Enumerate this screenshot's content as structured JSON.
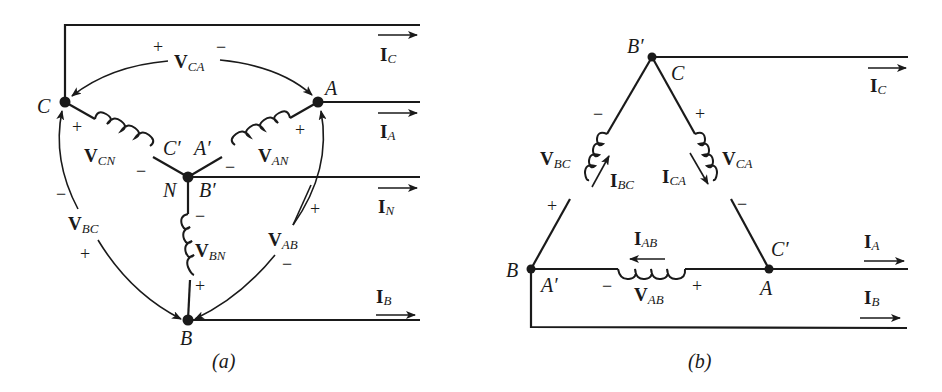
{
  "diagrams": [
    {
      "id": "a",
      "caption": "(a)",
      "type": "wye-connection",
      "nodes": {
        "C": "C",
        "A": "A",
        "N": "N",
        "B_prime": "B′",
        "B": "B",
        "C_prime": "C′",
        "A_prime": "A′"
      },
      "voltages": {
        "V_CA": {
          "main": "V",
          "sub": "CA",
          "plus": "+",
          "minus": "−"
        },
        "V_CN": {
          "main": "V",
          "sub": "CN",
          "plus": "+",
          "minus": "−"
        },
        "V_AN": {
          "main": "V",
          "sub": "AN",
          "plus": "+",
          "minus": "−"
        },
        "V_BN": {
          "main": "V",
          "sub": "BN",
          "plus": "+",
          "minus": "−"
        },
        "V_BC": {
          "main": "V",
          "sub": "BC",
          "plus": "+",
          "minus": "−"
        },
        "V_AB": {
          "main": "V",
          "sub": "AB",
          "plus": "+",
          "minus": "−"
        }
      },
      "currents": {
        "I_C": {
          "main": "I",
          "sub": "C"
        },
        "I_A": {
          "main": "I",
          "sub": "A"
        },
        "I_N": {
          "main": "I",
          "sub": "N"
        },
        "I_B": {
          "main": "I",
          "sub": "B"
        }
      }
    },
    {
      "id": "b",
      "caption": "(b)",
      "type": "delta-connection",
      "nodes": {
        "B_prime": "B′",
        "C": "C",
        "B": "B",
        "A_prime": "A′",
        "C_prime": "C′",
        "A": "A"
      },
      "voltages": {
        "V_BC": {
          "main": "V",
          "sub": "BC",
          "plus": "+",
          "minus": "−"
        },
        "V_CA": {
          "main": "V",
          "sub": "CA",
          "plus": "+",
          "minus": "−"
        },
        "V_AB": {
          "main": "V",
          "sub": "AB",
          "plus": "+",
          "minus": "−"
        }
      },
      "currents": {
        "I_C": {
          "main": "I",
          "sub": "C"
        },
        "I_A": {
          "main": "I",
          "sub": "A"
        },
        "I_B": {
          "main": "I",
          "sub": "B"
        },
        "I_BC": {
          "main": "I",
          "sub": "BC"
        },
        "I_CA": {
          "main": "I",
          "sub": "CA"
        },
        "I_AB": {
          "main": "I",
          "sub": "AB"
        }
      }
    }
  ]
}
